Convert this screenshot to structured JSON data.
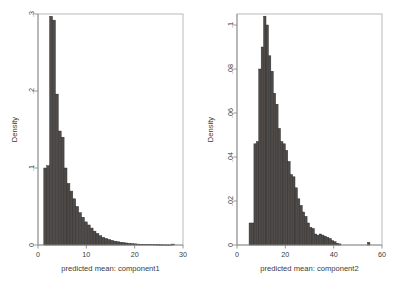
{
  "figure": {
    "background_color": "#ffffff",
    "bar_fill_color": "#4e4b49",
    "bar_edge_color": "#2e2c2b",
    "frame_color": "#b9b9b9",
    "axis_color": "#8c8c8c",
    "text_color": "#3b3b3b"
  },
  "chart_data": [
    {
      "type": "bar",
      "title": "",
      "subtitle": "",
      "xlabel": "predicted mean: component1",
      "ylabel": "Density",
      "xlim": [
        0,
        30
      ],
      "ylim": [
        0,
        0.3
      ],
      "xticks": [
        0,
        10,
        20,
        30
      ],
      "xticklabels": [
        "0",
        "10",
        "20",
        "30"
      ],
      "yticks": [
        0,
        0.1,
        0.2,
        0.3
      ],
      "yticklabels": [
        "0",
        ".1",
        ".2",
        ".3"
      ],
      "grid": false,
      "legend": null,
      "bin_width": 0.6,
      "bin_starts": [
        1.2,
        1.8,
        2.4,
        3.0,
        3.6,
        4.2,
        4.8,
        5.4,
        6.0,
        6.6,
        7.2,
        7.8,
        8.4,
        9.0,
        9.6,
        10.2,
        10.8,
        11.4,
        12.0,
        12.6,
        13.2,
        13.8,
        14.4,
        15.0,
        15.6,
        16.2,
        16.8,
        17.4,
        18.0,
        18.6,
        19.2,
        19.8,
        20.4,
        21.0,
        21.6,
        22.2,
        22.8,
        23.4,
        24.0,
        24.6,
        25.2,
        25.8,
        26.4,
        27.0,
        27.6
      ],
      "values": [
        0.1,
        0.103,
        0.297,
        0.292,
        0.196,
        0.148,
        0.14,
        0.1,
        0.08,
        0.07,
        0.06,
        0.05,
        0.042,
        0.036,
        0.03,
        0.026,
        0.022,
        0.018,
        0.015,
        0.012,
        0.01,
        0.0085,
        0.0072,
        0.006,
        0.005,
        0.0042,
        0.0035,
        0.003,
        0.0026,
        0.0022,
        0.0018,
        0.0015,
        0.0012,
        0.001,
        0.0009,
        0.0007,
        0.0006,
        0.0005,
        0.0004,
        0.0003,
        0.0003,
        0.0002,
        0.0002,
        0.0001,
        0.0012
      ]
    },
    {
      "type": "bar",
      "title": "",
      "subtitle": "",
      "xlabel": "predicted mean: component2",
      "ylabel": "Density",
      "xlim": [
        0,
        60
      ],
      "ylim": [
        0,
        0.105
      ],
      "xticks": [
        0,
        20,
        40,
        60
      ],
      "xticklabels": [
        "0",
        "20",
        "40",
        "60"
      ],
      "yticks": [
        0,
        0.02,
        0.04,
        0.06,
        0.08,
        0.1
      ],
      "yticklabels": [
        "0",
        ".02",
        ".04",
        ".06",
        ".08",
        ".1"
      ],
      "grid": false,
      "legend": null,
      "bin_width": 1.0,
      "bin_starts": [
        5,
        6,
        7,
        8,
        9,
        10,
        11,
        12,
        13,
        14,
        15,
        16,
        17,
        18,
        19,
        20,
        21,
        22,
        23,
        24,
        25,
        26,
        27,
        28,
        29,
        30,
        31,
        32,
        33,
        34,
        35,
        36,
        37,
        38,
        39,
        40,
        41,
        42,
        54
      ],
      "values": [
        0.01,
        0.01,
        0.046,
        0.047,
        0.08,
        0.09,
        0.104,
        0.1,
        0.086,
        0.079,
        0.069,
        0.064,
        0.053,
        0.047,
        0.046,
        0.043,
        0.038,
        0.032,
        0.031,
        0.026,
        0.021,
        0.018,
        0.015,
        0.013,
        0.01,
        0.008,
        0.0075,
        0.005,
        0.0045,
        0.005,
        0.0045,
        0.004,
        0.0035,
        0.003,
        0.002,
        0.0015,
        0.0008,
        0.0005,
        0.0012
      ]
    }
  ]
}
